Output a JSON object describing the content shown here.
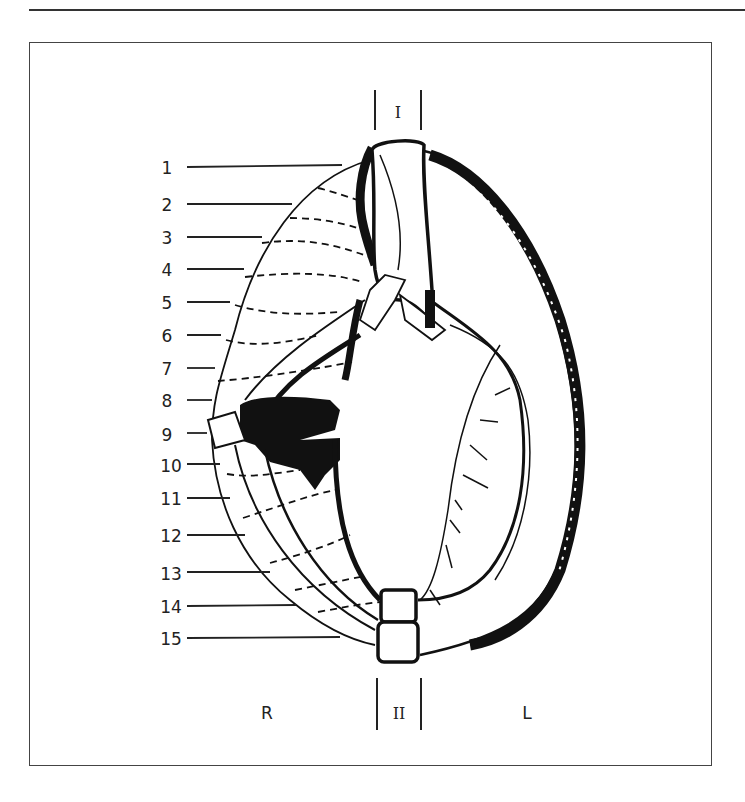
{
  "figure": {
    "frame_label": "Diagram frame",
    "top_marker": "I",
    "bottom_marker": "II",
    "left_side": "R",
    "right_side": "L",
    "numbered_labels": [
      "1",
      "2",
      "3",
      "4",
      "5",
      "6",
      "7",
      "8",
      "9",
      "10",
      "11",
      "12",
      "13",
      "14",
      "15"
    ]
  },
  "colors": {
    "ink": "#111111",
    "frame": "#444444",
    "background": "#ffffff"
  }
}
